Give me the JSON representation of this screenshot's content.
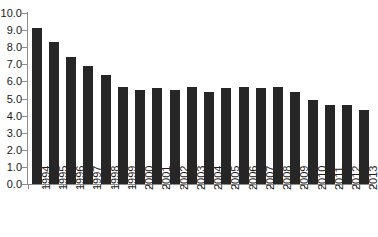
{
  "chart_data": {
    "type": "bar",
    "title": "",
    "subtitle": "",
    "xlabel": "",
    "ylabel": "",
    "categories": [
      "1994",
      "1995",
      "1996",
      "1997",
      "1998",
      "1999",
      "2000",
      "2001",
      "2002",
      "2003",
      "2004",
      "2005",
      "2006",
      "2007",
      "2008",
      "2009",
      "2010",
      "2011",
      "2012",
      "2013"
    ],
    "values": [
      9.1,
      8.3,
      7.4,
      6.9,
      6.4,
      5.7,
      5.5,
      5.6,
      5.5,
      5.7,
      5.4,
      5.6,
      5.7,
      5.6,
      5.7,
      5.4,
      4.9,
      4.6,
      4.6,
      4.3
    ],
    "series": [
      {
        "name": "rate",
        "values": [
          9.1,
          8.3,
          7.4,
          6.9,
          6.4,
          5.7,
          5.5,
          5.6,
          5.5,
          5.7,
          5.4,
          5.6,
          5.7,
          5.6,
          5.7,
          5.4,
          4.9,
          4.6,
          4.6,
          4.3
        ]
      }
    ],
    "ylim": [
      0.0,
      10.0
    ],
    "ytick_values": [
      0.0,
      1.0,
      2.0,
      3.0,
      4.0,
      5.0,
      6.0,
      7.0,
      8.0,
      9.0,
      10.0
    ],
    "ytick_labels": [
      "0.0",
      "1.0",
      "2.0",
      "3.0",
      "4.0",
      "5.0",
      "6.0",
      "7.0",
      "8.0",
      "9.0",
      "10.0"
    ],
    "grid": false,
    "legend": false,
    "legend_position": "none",
    "bar_color": "#262626",
    "axis_color": "#8d8d8d",
    "text_color": "#1a1a1a",
    "background_color": "#ffffff"
  }
}
